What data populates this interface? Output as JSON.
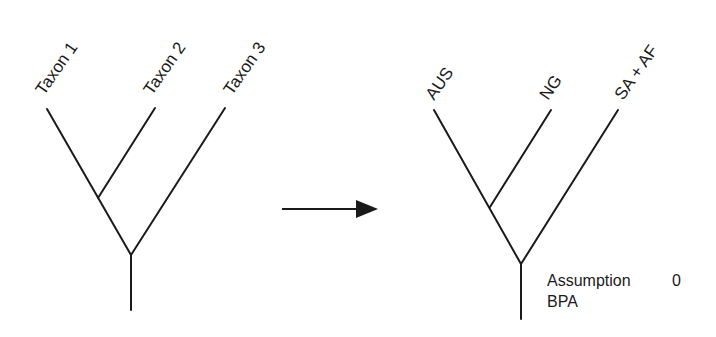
{
  "left_tree": {
    "taxa": [
      {
        "label": "Taxon 1"
      },
      {
        "label": "Taxon 2"
      },
      {
        "label": "Taxon 3"
      }
    ]
  },
  "arrow": {
    "direction": "right",
    "icon": "right-arrow-icon"
  },
  "right_tree": {
    "taxa": [
      {
        "label": "AUS"
      },
      {
        "label": "NG"
      },
      {
        "label": "SA + AF"
      }
    ],
    "annotation": {
      "line1": "Assumption",
      "value": "0",
      "line2": "BPA"
    }
  },
  "colors": {
    "line": "#1a1a1a",
    "background": "#ffffff"
  }
}
